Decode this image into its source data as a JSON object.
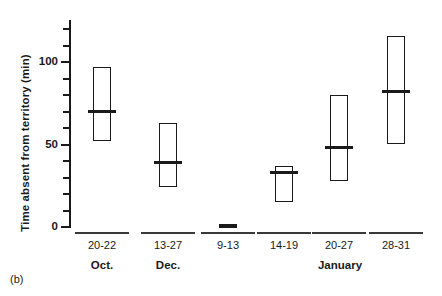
{
  "panel": {
    "caption": "(b)"
  },
  "chart_data": {
    "type": "bar",
    "title": "",
    "subtitle": "",
    "xlabel": "",
    "ylabel": "Time absent from territory (min)",
    "ylim": [
      0,
      125
    ],
    "yticks_major": [
      0,
      50,
      100
    ],
    "yticks_major_labels": [
      "0",
      "50",
      "100"
    ],
    "yticks_minor": [
      10,
      20,
      30,
      40,
      60,
      70,
      80,
      90,
      110,
      120
    ],
    "grid": false,
    "legend": "none",
    "categories": [
      "20-22",
      "13-27",
      "9-13",
      "14-19",
      "20-27",
      "28-31"
    ],
    "months": [
      "Oct.",
      "Dec.",
      "Dec.",
      "January",
      "January",
      "January"
    ],
    "month_groups": [
      {
        "label": "Oct.",
        "categories": [
          "20-22"
        ]
      },
      {
        "label": "Dec.",
        "categories": [
          "13-27",
          "9-13"
        ]
      },
      {
        "label": "January",
        "categories": [
          "14-19",
          "20-27",
          "28-31"
        ]
      }
    ],
    "series": [
      {
        "name": "minimum",
        "values": [
          52,
          24,
          0,
          15,
          28,
          50
        ]
      },
      {
        "name": "median",
        "values": [
          70,
          39,
          0,
          33,
          48,
          82
        ]
      },
      {
        "name": "maximum",
        "values": [
          97,
          63,
          1,
          37,
          80,
          116
        ]
      }
    ],
    "boxes": [
      {
        "category": "20-22",
        "month": "Oct.",
        "min": 52,
        "median": 70,
        "max": 97
      },
      {
        "category": "13-27",
        "month": "Dec.",
        "min": 24,
        "median": 39,
        "max": 63
      },
      {
        "category": "9-13",
        "month": "Dec.",
        "min": 0,
        "median": 0,
        "max": 1
      },
      {
        "category": "14-19",
        "month": "January",
        "min": 15,
        "median": 33,
        "max": 37
      },
      {
        "category": "20-27",
        "month": "January",
        "min": 28,
        "median": 48,
        "max": 80
      },
      {
        "category": "28-31",
        "month": "January",
        "min": 50,
        "median": 82,
        "max": 116
      }
    ]
  }
}
